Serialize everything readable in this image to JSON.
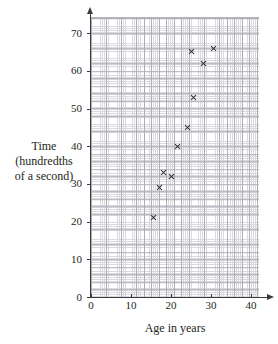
{
  "chart_data": {
    "type": "scatter",
    "title": "",
    "xlabel": "Age in years",
    "ylabel": "Time (hundredths of a second)",
    "ylabel_lines": [
      "Time",
      "(hundredths",
      "of a second)"
    ],
    "xlim": [
      0,
      45
    ],
    "ylim": [
      0,
      75
    ],
    "x_ticks": [
      0,
      10,
      20,
      30,
      40
    ],
    "y_ticks": [
      0,
      10,
      20,
      30,
      40,
      50,
      60,
      70
    ],
    "x_tick_labels": [
      "0",
      "10",
      "20",
      "30",
      "40"
    ],
    "y_tick_labels": [
      "0",
      "10",
      "20",
      "30",
      "40",
      "50",
      "60",
      "70"
    ],
    "grid": true,
    "grid_minor_step": 0.5,
    "grid_major_step": 2,
    "legend": null,
    "marker": "x",
    "marker_color": "#2a2a2e",
    "axis_color": "#3b3b3f",
    "grid_minor_color": "#d9d9de",
    "grid_major_color": "#aeaeb6",
    "points": [
      {
        "x": 15.5,
        "y": 21
      },
      {
        "x": 17,
        "y": 29
      },
      {
        "x": 18,
        "y": 33
      },
      {
        "x": 20,
        "y": 32
      },
      {
        "x": 21.5,
        "y": 40
      },
      {
        "x": 24,
        "y": 45
      },
      {
        "x": 25.5,
        "y": 53
      },
      {
        "x": 25,
        "y": 65
      },
      {
        "x": 28,
        "y": 62
      },
      {
        "x": 30.5,
        "y": 66
      }
    ]
  }
}
